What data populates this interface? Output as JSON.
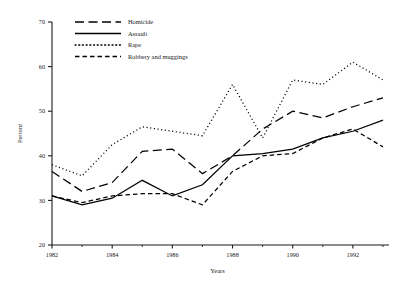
{
  "chart_data": {
    "type": "line",
    "title": "",
    "xlabel": "Years",
    "ylabel": "Percent",
    "xlim": [
      1982,
      1993
    ],
    "ylim": [
      20,
      70
    ],
    "ytick_step": 10,
    "yticks": [
      20,
      30,
      40,
      50,
      60,
      70
    ],
    "xticks": [
      1982,
      1984,
      1986,
      1988,
      1990,
      1992
    ],
    "xticks_minor": [
      1983,
      1985,
      1987,
      1989,
      1991,
      1993
    ],
    "grid": false,
    "legend_position": "top-center",
    "x": [
      1982,
      1983,
      1984,
      1985,
      1986,
      1987,
      1988,
      1989,
      1990,
      1991,
      1992,
      1993
    ],
    "series": [
      {
        "name": "Homicide",
        "dash": "long-dash",
        "values": [
          36.5,
          32.0,
          34.0,
          41.0,
          41.5,
          36.0,
          40.0,
          46.0,
          50.0,
          48.5,
          51.0,
          53.0
        ]
      },
      {
        "name": "Assault",
        "dash": "solid",
        "values": [
          31.0,
          29.0,
          30.5,
          34.5,
          31.0,
          33.5,
          40.0,
          40.5,
          41.5,
          44.0,
          45.5,
          48.0
        ]
      },
      {
        "name": "Rape",
        "dash": "dotted",
        "values": [
          38.0,
          35.5,
          42.5,
          46.5,
          45.5,
          44.5,
          56.0,
          44.0,
          57.0,
          56.0,
          61.0,
          57.0
        ]
      },
      {
        "name": "Robbery and muggings",
        "dash": "dashed",
        "values": [
          31.0,
          29.5,
          31.0,
          31.5,
          31.5,
          29.0,
          36.5,
          40.0,
          40.5,
          44.0,
          46.0,
          42.0
        ]
      }
    ]
  },
  "axis": {
    "y_label": "Percent",
    "x_label": "Years",
    "y_tick_labels": [
      "20",
      "30",
      "40",
      "50",
      "60",
      "70"
    ],
    "x_tick_labels": [
      "1982",
      "1984",
      "1986",
      "1988",
      "1990",
      "1992"
    ]
  },
  "legend": {
    "items": [
      {
        "label": "Homicide",
        "style": "long-dash"
      },
      {
        "label": "Assault",
        "style": "solid"
      },
      {
        "label": "Rape",
        "style": "dotted"
      },
      {
        "label": "Robbery and muggings",
        "style": "dashed"
      }
    ]
  },
  "colors": {
    "ink": "#1a1a1a",
    "background": "#ffffff"
  }
}
